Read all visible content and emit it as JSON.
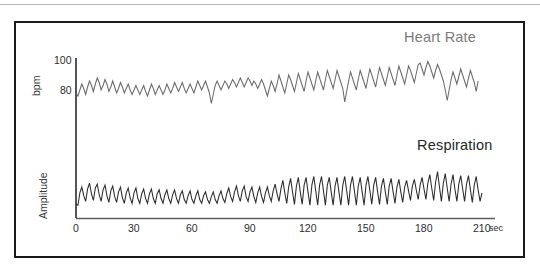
{
  "figure": {
    "border_color": "#1a1a1a",
    "background": "#ffffff",
    "top_rule_color": "#b9b9b9"
  },
  "chart_data": {
    "type": "line",
    "title": "",
    "xlabel": "sec",
    "grid": false,
    "legend_position": "inside-right",
    "xlim": [
      0,
      218
    ],
    "x_ticks": [
      0,
      30,
      60,
      90,
      120,
      150,
      180,
      210
    ],
    "x_tick_labels": [
      "0",
      "30",
      "60",
      "90",
      "120",
      "150",
      "180",
      "210"
    ],
    "x_unit_suffix": "sec",
    "panels": [
      {
        "name": "heart-rate",
        "label": "Heart Rate",
        "label_color": "#7b7b7b",
        "line_color": "#6a6a6a",
        "ylabel": "bpm",
        "y_ticks": [
          80,
          100
        ],
        "y_tick_labels": [
          "80",
          "100"
        ],
        "ylim": [
          66,
          103
        ],
        "series": [
          {
            "name": "Heart Rate",
            "unit": "bpm",
            "x": [
              0,
              1,
              2,
              3,
              4,
              5,
              6,
              7,
              8,
              9,
              10,
              11,
              12,
              13,
              14,
              15,
              16,
              17,
              18,
              19,
              20,
              21,
              22,
              23,
              24,
              25,
              26,
              27,
              28,
              29,
              30,
              31,
              32,
              33,
              34,
              35,
              36,
              37,
              38,
              39,
              40,
              41,
              42,
              43,
              44,
              45,
              46,
              47,
              48,
              49,
              50,
              51,
              52,
              53,
              54,
              55,
              56,
              57,
              58,
              59,
              60,
              61,
              62,
              63,
              64,
              65,
              66,
              67,
              68,
              69,
              70,
              71,
              72,
              73,
              74,
              75,
              76,
              77,
              78,
              79,
              80,
              81,
              82,
              83,
              84,
              85,
              86,
              87,
              88,
              89,
              90,
              91,
              92,
              93,
              94,
              95,
              96,
              97,
              98,
              99,
              100,
              101,
              102,
              103,
              104,
              105,
              106,
              107,
              108,
              109,
              110,
              111,
              112,
              113,
              114,
              115,
              116,
              117,
              118,
              119,
              120,
              121,
              122,
              123,
              124,
              125,
              126,
              127,
              128,
              129,
              130,
              131,
              132,
              133,
              134,
              135,
              136,
              137,
              138,
              139,
              140,
              141,
              142,
              143,
              144,
              145,
              146,
              147,
              148,
              149,
              150,
              151,
              152,
              153,
              154,
              155,
              156,
              157,
              158,
              159,
              160,
              161,
              162,
              163,
              164,
              165,
              166,
              167,
              168,
              169,
              170,
              171,
              172,
              173,
              174,
              175,
              176,
              177,
              178,
              179,
              180,
              181,
              182,
              183,
              184,
              185,
              186,
              187,
              188,
              189,
              190,
              191,
              192,
              193,
              194,
              195,
              196,
              197,
              198,
              199,
              200,
              201,
              202,
              203,
              204,
              205,
              206,
              207,
              208,
              209,
              210,
              211,
              212,
              213,
              214,
              215,
              216
            ],
            "values": [
              78,
              76,
              80,
              84,
              81,
              77,
              82,
              86,
              83,
              79,
              84,
              88,
              85,
              80,
              83,
              87,
              84,
              79,
              82,
              86,
              82,
              78,
              81,
              85,
              82,
              78,
              81,
              84,
              80,
              77,
              80,
              83,
              80,
              77,
              80,
              83,
              79,
              76,
              80,
              84,
              81,
              77,
              80,
              83,
              80,
              77,
              80,
              84,
              81,
              78,
              81,
              85,
              82,
              79,
              82,
              85,
              81,
              78,
              81,
              84,
              81,
              78,
              82,
              86,
              83,
              80,
              83,
              86,
              82,
              78,
              71,
              77,
              83,
              86,
              83,
              80,
              83,
              86,
              84,
              81,
              84,
              87,
              85,
              82,
              85,
              88,
              85,
              82,
              85,
              88,
              86,
              83,
              86,
              84,
              81,
              84,
              87,
              84,
              80,
              76,
              81,
              86,
              83,
              79,
              84,
              90,
              86,
              82,
              78,
              84,
              90,
              87,
              83,
              79,
              85,
              91,
              87,
              83,
              79,
              86,
              92,
              88,
              84,
              80,
              86,
              92,
              88,
              84,
              80,
              87,
              93,
              89,
              85,
              81,
              87,
              93,
              89,
              85,
              81,
              72,
              79,
              86,
              92,
              88,
              84,
              80,
              87,
              93,
              89,
              85,
              81,
              88,
              94,
              90,
              86,
              82,
              89,
              95,
              91,
              87,
              83,
              89,
              95,
              91,
              87,
              83,
              90,
              96,
              92,
              88,
              84,
              90,
              96,
              93,
              89,
              85,
              91,
              97,
              98,
              94,
              90,
              95,
              99,
              96,
              92,
              88,
              93,
              97,
              94,
              90,
              86,
              80,
              73,
              80,
              87,
              92,
              88,
              84,
              89,
              94,
              90,
              86,
              82,
              88,
              93,
              89,
              85,
              79,
              86
            ]
          }
        ]
      },
      {
        "name": "respiration",
        "label": "Respiration",
        "label_color": "#262626",
        "line_color": "#2b2b2b",
        "ylabel": "Amplitude",
        "y_ticks": [],
        "y_tick_labels": [],
        "ylim": [
          0,
          1
        ],
        "series": [
          {
            "name": "Respiration",
            "unit": "Amplitude",
            "x": [
              0,
              1,
              2,
              3,
              4,
              5,
              6,
              7,
              8,
              9,
              10,
              11,
              12,
              13,
              14,
              15,
              16,
              17,
              18,
              19,
              20,
              21,
              22,
              23,
              24,
              25,
              26,
              27,
              28,
              29,
              30,
              31,
              32,
              33,
              34,
              35,
              36,
              37,
              38,
              39,
              40,
              41,
              42,
              43,
              44,
              45,
              46,
              47,
              48,
              49,
              50,
              51,
              52,
              53,
              54,
              55,
              56,
              57,
              58,
              59,
              60,
              61,
              62,
              63,
              64,
              65,
              66,
              67,
              68,
              69,
              70,
              71,
              72,
              73,
              74,
              75,
              76,
              77,
              78,
              79,
              80,
              81,
              82,
              83,
              84,
              85,
              86,
              87,
              88,
              89,
              90,
              91,
              92,
              93,
              94,
              95,
              96,
              97,
              98,
              99,
              100,
              101,
              102,
              103,
              104,
              105,
              106,
              107,
              108,
              109,
              110,
              111,
              112,
              113,
              114,
              115,
              116,
              117,
              118,
              119,
              120,
              121,
              122,
              123,
              124,
              125,
              126,
              127,
              128,
              129,
              130,
              131,
              132,
              133,
              134,
              135,
              136,
              137,
              138,
              139,
              140,
              141,
              142,
              143,
              144,
              145,
              146,
              147,
              148,
              149,
              150,
              151,
              152,
              153,
              154,
              155,
              156,
              157,
              158,
              159,
              160,
              161,
              162,
              163,
              164,
              165,
              166,
              167,
              168,
              169,
              170,
              171,
              172,
              173,
              174,
              175,
              176,
              177,
              178,
              179,
              180,
              181,
              182,
              183,
              184,
              185,
              186,
              187,
              188,
              189,
              190,
              191,
              192,
              193,
              194,
              195,
              196,
              197,
              198,
              199,
              200,
              201,
              202,
              203,
              204,
              205,
              206,
              207,
              208,
              209,
              210,
              211,
              212,
              213,
              214,
              215,
              216
            ],
            "values": [
              0.16,
              0.14,
              0.4,
              0.52,
              0.34,
              0.22,
              0.48,
              0.6,
              0.38,
              0.24,
              0.5,
              0.58,
              0.36,
              0.22,
              0.46,
              0.56,
              0.34,
              0.2,
              0.44,
              0.54,
              0.32,
              0.2,
              0.42,
              0.52,
              0.3,
              0.18,
              0.4,
              0.5,
              0.3,
              0.18,
              0.4,
              0.5,
              0.28,
              0.18,
              0.38,
              0.48,
              0.28,
              0.18,
              0.38,
              0.48,
              0.28,
              0.18,
              0.38,
              0.46,
              0.28,
              0.18,
              0.36,
              0.46,
              0.28,
              0.18,
              0.36,
              0.46,
              0.28,
              0.18,
              0.36,
              0.44,
              0.26,
              0.18,
              0.34,
              0.44,
              0.26,
              0.18,
              0.34,
              0.44,
              0.26,
              0.18,
              0.34,
              0.42,
              0.26,
              0.18,
              0.32,
              0.42,
              0.26,
              0.18,
              0.34,
              0.44,
              0.28,
              0.2,
              0.38,
              0.5,
              0.32,
              0.22,
              0.42,
              0.54,
              0.34,
              0.22,
              0.44,
              0.54,
              0.32,
              0.22,
              0.42,
              0.52,
              0.32,
              0.2,
              0.4,
              0.52,
              0.32,
              0.2,
              0.4,
              0.52,
              0.34,
              0.22,
              0.44,
              0.58,
              0.38,
              0.22,
              0.48,
              0.66,
              0.4,
              0.18,
              0.52,
              0.7,
              0.42,
              0.16,
              0.54,
              0.72,
              0.42,
              0.16,
              0.56,
              0.72,
              0.42,
              0.14,
              0.56,
              0.74,
              0.44,
              0.14,
              0.56,
              0.74,
              0.44,
              0.14,
              0.56,
              0.72,
              0.42,
              0.14,
              0.54,
              0.72,
              0.42,
              0.14,
              0.56,
              0.74,
              0.44,
              0.14,
              0.56,
              0.74,
              0.44,
              0.14,
              0.54,
              0.72,
              0.42,
              0.14,
              0.56,
              0.74,
              0.44,
              0.16,
              0.56,
              0.72,
              0.42,
              0.16,
              0.54,
              0.7,
              0.42,
              0.16,
              0.54,
              0.7,
              0.42,
              0.18,
              0.52,
              0.68,
              0.42,
              0.2,
              0.52,
              0.66,
              0.44,
              0.24,
              0.54,
              0.68,
              0.46,
              0.26,
              0.56,
              0.72,
              0.48,
              0.26,
              0.6,
              0.78,
              0.5,
              0.24,
              0.62,
              0.84,
              0.52,
              0.22,
              0.6,
              0.8,
              0.5,
              0.22,
              0.58,
              0.78,
              0.48,
              0.22,
              0.58,
              0.76,
              0.48,
              0.22,
              0.58,
              0.76,
              0.46,
              0.2,
              0.56,
              0.74,
              0.46,
              0.22,
              0.4
            ]
          }
        ]
      }
    ]
  },
  "axes": {
    "y_heart_rate": {
      "tick_100": "100",
      "tick_80": "80",
      "title": "bpm"
    },
    "y_respiration": {
      "title": "Amplitude"
    },
    "x": {
      "unit": "sec",
      "ticks": [
        "0",
        "30",
        "60",
        "90",
        "120",
        "150",
        "180",
        "210"
      ]
    }
  },
  "labels": {
    "heart_rate": "Heart Rate",
    "respiration": "Respiration"
  }
}
